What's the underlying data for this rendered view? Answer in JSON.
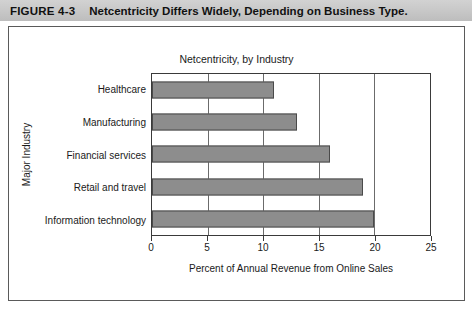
{
  "figure": {
    "number": "FIGURE 4-3",
    "title": "Netcentricity Differs Widely, Depending on Business Type."
  },
  "chart_data": {
    "type": "bar",
    "orientation": "horizontal",
    "title": "Netcentricity, by Industry",
    "xlabel": "Percent of Annual Revenue from Online Sales",
    "ylabel": "Major Industry",
    "categories": [
      "Healthcare",
      "Manufacturing",
      "Financial services",
      "Retail and travel",
      "Information technology"
    ],
    "values": [
      11,
      13,
      16,
      19,
      20
    ],
    "xlim": [
      0,
      25
    ],
    "xticks": [
      0,
      5,
      10,
      15,
      20,
      25
    ],
    "xtick_labels": [
      "0",
      "5",
      "10",
      "15",
      "20",
      "25"
    ],
    "grid": "vertical",
    "legend": "none",
    "bar_color": "#8d8d8d",
    "bar_edge_color": "#4a4a4a"
  }
}
